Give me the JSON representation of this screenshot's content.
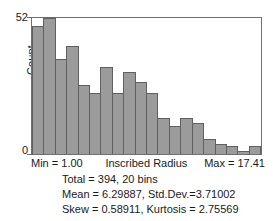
{
  "chart_data": {
    "type": "bar",
    "title": "",
    "xlabel": "Inscribed Radius",
    "ylabel": "Count",
    "ylim": [
      0,
      52
    ],
    "yticks": [
      0,
      52
    ],
    "ytick_labels": [
      "0",
      "52"
    ],
    "grid": false,
    "legend": null,
    "bins": 20,
    "x_min_label": "Min = 1.00",
    "x_max_label": "Max = 17.41",
    "x_range": [
      1.0,
      17.41
    ],
    "categories": [
      "1",
      "2",
      "3",
      "4",
      "5",
      "6",
      "7",
      "8",
      "9",
      "10",
      "11",
      "12",
      "13",
      "14",
      "15",
      "16",
      "17",
      "18",
      "19",
      "20"
    ],
    "values": [
      50,
      53,
      37,
      42,
      27,
      24,
      34,
      24,
      32,
      28,
      24,
      14,
      11,
      14,
      12,
      6,
      4,
      3,
      1,
      3
    ]
  },
  "axes": {
    "y_label": "Count",
    "y_tick_top": "52",
    "y_tick_bottom": "0",
    "x_min": "Min = 1.00",
    "x_title": "Inscribed Radius",
    "x_max": "Max = 17.41"
  },
  "stats": {
    "line1": "Total = 394, 20 bins",
    "line2": "Mean = 6.29887, Std.Dev.=3.71002",
    "line3": "Skew = 0.58911, Kurtosis = 2.75569"
  },
  "colors": {
    "bar_fill": "#9b9b9b",
    "bar_stroke": "#606060",
    "frame": "#6f6f6f",
    "text": "#1a1a1a",
    "background": "#ffffff"
  }
}
